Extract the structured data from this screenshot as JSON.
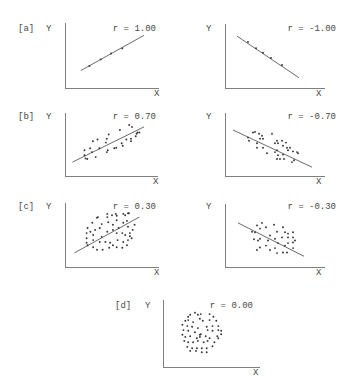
{
  "colors": {
    "background": "#ffffff",
    "axis": "#808080",
    "text": "#4a4a4a",
    "points": "#333333",
    "regression_line": "#5a5a5a"
  },
  "chart_data": [
    {
      "type": "scatter",
      "panel": "[a]",
      "title": "r = 1.00",
      "r": 1.0,
      "xlabel": "X",
      "ylabel": "Y",
      "xlim": [
        0,
        100
      ],
      "ylim": [
        0,
        100
      ],
      "grid": false,
      "regression_line": [
        [
          17,
          27
        ],
        [
          84,
          81
        ]
      ],
      "points": [
        [
          26,
          34
        ],
        [
          38,
          44
        ],
        [
          49,
          53
        ],
        [
          61,
          61
        ]
      ]
    },
    {
      "type": "scatter",
      "panel": "",
      "title": "r = -1.00",
      "r": -1.0,
      "xlabel": "X",
      "ylabel": "Y",
      "xlim": [
        0,
        100
      ],
      "ylim": [
        0,
        100
      ],
      "grid": false,
      "regression_line": [
        [
          12,
          81
        ],
        [
          74,
          16
        ]
      ],
      "points": [
        [
          23,
          72
        ],
        [
          31,
          62
        ],
        [
          38,
          55
        ],
        [
          46,
          47
        ],
        [
          57,
          36
        ]
      ]
    },
    {
      "type": "scatter",
      "panel": "[b]",
      "title": "r = 0.70",
      "r": 0.7,
      "xlabel": "X",
      "ylabel": "Y",
      "xlim": [
        0,
        100
      ],
      "ylim": [
        0,
        100
      ],
      "grid": false,
      "regression_line": [
        [
          8,
          22
        ],
        [
          85,
          78
        ]
      ],
      "points": [
        [
          21,
          41
        ],
        [
          27,
          44
        ],
        [
          29,
          38
        ],
        [
          21,
          33
        ],
        [
          22,
          28
        ],
        [
          24,
          27
        ],
        [
          30,
          55
        ],
        [
          35,
          58
        ],
        [
          33,
          30
        ],
        [
          37,
          44
        ],
        [
          44,
          53
        ],
        [
          45,
          59
        ],
        [
          47,
          66
        ],
        [
          45,
          38
        ],
        [
          46,
          41
        ],
        [
          53,
          44
        ],
        [
          55,
          45
        ],
        [
          59,
          73
        ],
        [
          61,
          52
        ],
        [
          62,
          48
        ],
        [
          66,
          58
        ],
        [
          69,
          81
        ],
        [
          72,
          78
        ],
        [
          71,
          59
        ],
        [
          71,
          55
        ],
        [
          76,
          63
        ],
        [
          78,
          69
        ],
        [
          80,
          69
        ],
        [
          77,
          67
        ]
      ]
    },
    {
      "type": "scatter",
      "panel": "",
      "title": "r = -0.70",
      "r": -0.7,
      "xlabel": "X",
      "ylabel": "Y",
      "xlim": [
        0,
        100
      ],
      "ylim": [
        0,
        100
      ],
      "grid": false,
      "regression_line": [
        [
          8,
          73
        ],
        [
          87,
          14
        ]
      ],
      "points": [
        [
          28,
          69
        ],
        [
          30,
          70
        ],
        [
          34,
          67
        ],
        [
          37,
          64
        ],
        [
          38,
          59
        ],
        [
          35,
          59
        ],
        [
          23,
          61
        ],
        [
          24,
          56
        ],
        [
          32,
          52
        ],
        [
          32,
          45
        ],
        [
          38,
          45
        ],
        [
          42,
          36
        ],
        [
          47,
          67
        ],
        [
          50,
          52
        ],
        [
          52,
          56
        ],
        [
          53,
          52
        ],
        [
          57,
          56
        ],
        [
          58,
          48
        ],
        [
          61,
          53
        ],
        [
          62,
          45
        ],
        [
          50,
          38
        ],
        [
          52,
          41
        ],
        [
          53,
          33
        ],
        [
          58,
          34
        ],
        [
          52,
          27
        ],
        [
          55,
          27
        ],
        [
          59,
          27
        ],
        [
          63,
          41
        ],
        [
          68,
          39
        ],
        [
          72,
          38
        ],
        [
          73,
          36
        ],
        [
          67,
          22
        ],
        [
          69,
          25
        ],
        [
          65,
          45
        ]
      ]
    },
    {
      "type": "scatter",
      "panel": "[c]",
      "title": "r = 0.30",
      "r": 0.3,
      "xlabel": "X",
      "ylabel": "Y",
      "xlim": [
        0,
        100
      ],
      "ylim": [
        0,
        100
      ],
      "grid": false,
      "regression_line": [
        [
          10,
          22
        ],
        [
          79,
          78
        ]
      ],
      "points": [
        [
          34,
          77
        ],
        [
          35,
          78
        ],
        [
          45,
          83
        ],
        [
          45,
          78
        ],
        [
          50,
          81
        ],
        [
          54,
          83
        ],
        [
          55,
          80
        ],
        [
          62,
          83
        ],
        [
          64,
          81
        ],
        [
          67,
          84
        ],
        [
          68,
          84
        ],
        [
          29,
          69
        ],
        [
          39,
          67
        ],
        [
          46,
          70
        ],
        [
          51,
          66
        ],
        [
          55,
          73
        ],
        [
          62,
          69
        ],
        [
          66,
          72
        ],
        [
          24,
          61
        ],
        [
          32,
          58
        ],
        [
          37,
          61
        ],
        [
          45,
          55
        ],
        [
          51,
          58
        ],
        [
          57,
          61
        ],
        [
          67,
          63
        ],
        [
          74,
          66
        ],
        [
          23,
          53
        ],
        [
          27,
          55
        ],
        [
          30,
          50
        ],
        [
          39,
          47
        ],
        [
          55,
          53
        ],
        [
          61,
          53
        ],
        [
          64,
          50
        ],
        [
          69,
          53
        ],
        [
          72,
          58
        ],
        [
          23,
          45
        ],
        [
          30,
          42
        ],
        [
          37,
          39
        ],
        [
          43,
          39
        ],
        [
          48,
          38
        ],
        [
          51,
          34
        ],
        [
          56,
          42
        ],
        [
          62,
          39
        ],
        [
          67,
          42
        ],
        [
          71,
          45
        ],
        [
          69,
          48
        ],
        [
          23,
          38
        ],
        [
          24,
          34
        ],
        [
          30,
          31
        ],
        [
          34,
          27
        ],
        [
          40,
          27
        ],
        [
          47,
          30
        ],
        [
          55,
          31
        ],
        [
          61,
          30
        ],
        [
          66,
          34
        ]
      ]
    },
    {
      "type": "scatter",
      "panel": "",
      "title": "r = -0.30",
      "r": -0.3,
      "xlabel": "X",
      "ylabel": "Y",
      "xlim": [
        0,
        100
      ],
      "ylim": [
        0,
        100
      ],
      "grid": false,
      "regression_line": [
        [
          13,
          70
        ],
        [
          79,
          17
        ]
      ],
      "points": [
        [
          32,
          66
        ],
        [
          37,
          70
        ],
        [
          41,
          63
        ],
        [
          35,
          61
        ],
        [
          30,
          55
        ],
        [
          27,
          56
        ],
        [
          49,
          67
        ],
        [
          52,
          56
        ],
        [
          58,
          63
        ],
        [
          60,
          55
        ],
        [
          63,
          53
        ],
        [
          68,
          55
        ],
        [
          45,
          50
        ],
        [
          50,
          45
        ],
        [
          57,
          47
        ],
        [
          63,
          47
        ],
        [
          68,
          47
        ],
        [
          70,
          42
        ],
        [
          29,
          44
        ],
        [
          33,
          42
        ],
        [
          35,
          45
        ],
        [
          43,
          42
        ],
        [
          53,
          38
        ],
        [
          60,
          34
        ],
        [
          63,
          38
        ],
        [
          68,
          39
        ],
        [
          41,
          34
        ],
        [
          35,
          31
        ],
        [
          32,
          27
        ],
        [
          45,
          27
        ],
        [
          50,
          30
        ],
        [
          52,
          22
        ],
        [
          58,
          23
        ],
        [
          62,
          23
        ],
        [
          68,
          30
        ]
      ]
    },
    {
      "type": "scatter",
      "panel": "[d]",
      "title": "r = 0.00",
      "r": 0.0,
      "xlabel": "X",
      "ylabel": "Y",
      "xlim": [
        0,
        100
      ],
      "ylim": [
        0,
        100
      ],
      "grid": false,
      "regression_line": null,
      "points": [
        [
          26,
          75
        ],
        [
          28,
          78
        ],
        [
          33,
          81
        ],
        [
          36,
          78
        ],
        [
          39,
          79
        ],
        [
          48,
          79
        ],
        [
          52,
          75
        ],
        [
          23,
          69
        ],
        [
          26,
          70
        ],
        [
          31,
          67
        ],
        [
          38,
          72
        ],
        [
          41,
          69
        ],
        [
          48,
          70
        ],
        [
          55,
          69
        ],
        [
          20,
          63
        ],
        [
          25,
          61
        ],
        [
          30,
          60
        ],
        [
          36,
          58
        ],
        [
          45,
          60
        ],
        [
          51,
          61
        ],
        [
          57,
          61
        ],
        [
          21,
          55
        ],
        [
          26,
          54
        ],
        [
          33,
          52
        ],
        [
          39,
          49
        ],
        [
          46,
          55
        ],
        [
          51,
          54
        ],
        [
          57,
          55
        ],
        [
          60,
          54
        ],
        [
          20,
          48
        ],
        [
          23,
          45
        ],
        [
          28,
          46
        ],
        [
          35,
          43
        ],
        [
          38,
          45
        ],
        [
          38,
          48
        ],
        [
          44,
          46
        ],
        [
          48,
          43
        ],
        [
          56,
          46
        ],
        [
          60,
          49
        ],
        [
          22,
          39
        ],
        [
          26,
          37
        ],
        [
          31,
          37
        ],
        [
          36,
          39
        ],
        [
          42,
          37
        ],
        [
          46,
          39
        ],
        [
          53,
          37
        ],
        [
          57,
          43
        ],
        [
          25,
          30
        ],
        [
          30,
          28
        ],
        [
          35,
          28
        ],
        [
          40,
          28
        ],
        [
          45,
          28
        ],
        [
          51,
          31
        ],
        [
          28,
          24
        ],
        [
          34,
          24
        ],
        [
          40,
          22
        ],
        [
          45,
          22
        ]
      ]
    }
  ]
}
